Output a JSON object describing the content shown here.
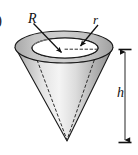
{
  "figure": {
    "panel_label": ")",
    "labels": {
      "outer_radius": "R",
      "inner_radius": "r",
      "height": "h"
    },
    "colors": {
      "outline": "#1a1a1a",
      "rim_top": "#b9b9b9",
      "rim_inner_wall": "#d8d8d8",
      "cone_light": "#f2f2f2",
      "cone_mid": "#c8c8c8",
      "cone_dark": "#8f8f8f",
      "hidden_line": "#3a3a3a",
      "white": "#ffffff"
    },
    "geometry": {
      "outer_ellipse": {
        "cx": 64,
        "cy": 47,
        "rx": 49,
        "ry": 16
      },
      "inner_ellipse": {
        "cx": 65,
        "cy": 48,
        "rx": 33,
        "ry": 10
      },
      "apex": {
        "x": 67,
        "y": 141
      },
      "dimension_line": {
        "x": 125,
        "y_top": 50,
        "y_bottom": 142
      }
    },
    "annotations": [
      {
        "name": "radius-R-arrow",
        "from": [
          33,
          24
        ],
        "to": [
          62,
          53
        ]
      },
      {
        "name": "radius-r-arrow",
        "from": [
          97,
          25
        ],
        "to": [
          79,
          47
        ]
      },
      {
        "name": "radius-r-dashed",
        "from": [
          65,
          49
        ],
        "to": [
          97,
          49
        ]
      },
      {
        "name": "hidden-base-arc",
        "desc": "dashed ellipse arc of inner cone base"
      },
      {
        "name": "hidden-slant-left",
        "from": [
          33,
          50
        ],
        "to": [
          67,
          140
        ]
      },
      {
        "name": "hidden-slant-right",
        "from": [
          98,
          50
        ],
        "to": [
          67,
          140
        ]
      }
    ]
  }
}
